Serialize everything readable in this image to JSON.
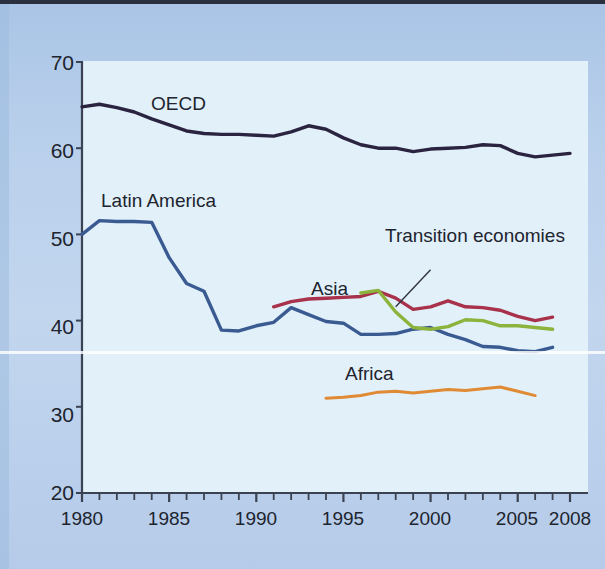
{
  "figure": {
    "background_color": "#b3cbe8",
    "plot_background_color": "#e2f0fa",
    "border_color": "#2b3040"
  },
  "axes": {
    "y_ticks": [
      "70",
      "60",
      "50",
      "40",
      "30",
      "20"
    ],
    "x_ticks": [
      "1980",
      "1985",
      "1990",
      "1995",
      "2000",
      "2005",
      "2008"
    ]
  },
  "labels": {
    "oecd": "OECD",
    "latin_america": "Latin America",
    "transition": "Transition economies",
    "asia": "Asia",
    "africa": "Africa"
  },
  "chart_data": {
    "type": "line",
    "title": "",
    "xlabel": "",
    "ylabel": "",
    "xlim": [
      1980,
      2008
    ],
    "ylim": [
      20,
      70
    ],
    "y_ticks": [
      70,
      60,
      50,
      40,
      30,
      20
    ],
    "x_ticks": [
      1980,
      1985,
      1990,
      1995,
      2000,
      2005,
      2008
    ],
    "x_minor_tick_interval": 1,
    "grid": false,
    "legend": "inline-annotations",
    "series": [
      {
        "name": "OECD",
        "color": "#2b2440",
        "label_position": {
          "x": 1984.0,
          "y": 65.6
        },
        "x": [
          1980,
          1981,
          1982,
          1983,
          1984,
          1985,
          1986,
          1987,
          1988,
          1989,
          1990,
          1991,
          1992,
          1993,
          1994,
          1995,
          1996,
          1997,
          1998,
          1999,
          2000,
          2001,
          2002,
          2003,
          2004,
          2005,
          2006,
          2007,
          2008
        ],
        "y": [
          64.8,
          65.1,
          64.7,
          64.2,
          63.4,
          62.7,
          62.0,
          61.7,
          61.6,
          61.6,
          61.5,
          61.4,
          61.9,
          62.6,
          62.2,
          61.2,
          60.4,
          60.0,
          60.0,
          59.6,
          59.9,
          60.0,
          60.1,
          60.4,
          60.3,
          59.4,
          59.0,
          59.2,
          59.4
        ]
      },
      {
        "name": "Latin America",
        "color": "#3a5a92",
        "label_position": {
          "x": 1981.6,
          "y": 54.2
        },
        "x": [
          1980,
          1981,
          1982,
          1983,
          1984,
          1985,
          1986,
          1987,
          1988,
          1989,
          1990,
          1991,
          1992,
          1993,
          1994,
          1995,
          1996,
          1997,
          1998,
          1999,
          2000,
          2001,
          2002,
          2003,
          2004,
          2005,
          2006,
          2007
        ],
        "y": [
          50.0,
          51.6,
          51.5,
          51.5,
          51.4,
          47.3,
          44.3,
          43.4,
          38.9,
          38.8,
          39.4,
          39.8,
          41.5,
          40.7,
          39.9,
          39.7,
          38.4,
          38.4,
          38.5,
          39.0,
          39.2,
          38.4,
          37.8,
          37.0,
          36.9,
          36.5,
          36.4,
          36.9
        ]
      },
      {
        "name": "Asia",
        "color": "#a8324a",
        "label_position": {
          "x": 1994.6,
          "y": 43.6
        },
        "x": [
          1991,
          1992,
          1993,
          1994,
          1995,
          1996,
          1997,
          1998,
          1999,
          2000,
          2001,
          2002,
          2003,
          2004,
          2005,
          2006,
          2007
        ],
        "y": [
          41.6,
          42.2,
          42.5,
          42.6,
          42.7,
          42.8,
          43.4,
          42.6,
          41.3,
          41.6,
          42.3,
          41.6,
          41.5,
          41.2,
          40.5,
          40.0,
          40.4
        ]
      },
      {
        "name": "Transition economies",
        "color": "#8cb33c",
        "label_position": {
          "x": 2000.6,
          "y": 46.8
        },
        "leader_line": {
          "from": {
            "x": 2000.0,
            "y": 45.9
          },
          "to": {
            "x": 1998.0,
            "y": 41.6
          }
        },
        "x": [
          1996,
          1997,
          1998,
          1999,
          2000,
          2001,
          2002,
          2003,
          2004,
          2005,
          2006,
          2007
        ],
        "y": [
          43.2,
          43.5,
          41.0,
          39.2,
          39.0,
          39.3,
          40.1,
          40.0,
          39.4,
          39.4,
          39.2,
          39.0
        ]
      },
      {
        "name": "Africa",
        "color": "#e08a33",
        "label_position": {
          "x": 1998.8,
          "y": 33.6
        },
        "x": [
          1994,
          1995,
          1996,
          1997,
          1998,
          1999,
          2000,
          2001,
          2002,
          2003,
          2004,
          2005,
          2006
        ],
        "y": [
          31.0,
          31.1,
          31.3,
          31.7,
          31.8,
          31.6,
          31.8,
          32.0,
          31.9,
          32.1,
          32.3,
          31.8,
          31.3
        ]
      }
    ]
  }
}
